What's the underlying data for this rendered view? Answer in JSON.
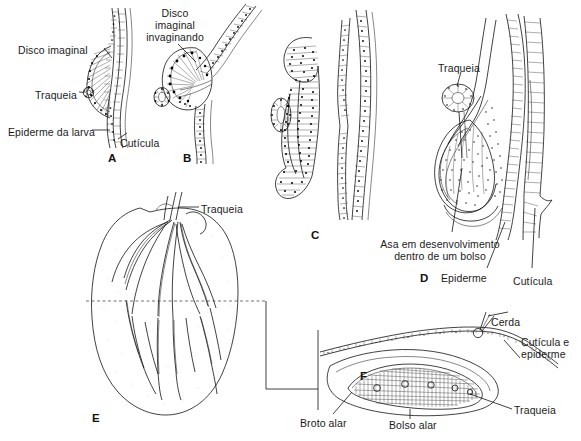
{
  "figure": {
    "language": "pt-BR",
    "style": "line-art scientific illustration, black ink on white"
  },
  "panels": [
    {
      "id": "A",
      "letter": "A",
      "letter_pos": {
        "x": 108,
        "y": 152
      },
      "labels": [
        {
          "key": "disco-imaginal",
          "text": "Disco imaginal",
          "x": 18,
          "y": 44,
          "align": "left"
        },
        {
          "key": "traqueia",
          "text": "Traqueia",
          "x": 35,
          "y": 89,
          "align": "left"
        },
        {
          "key": "epiderme-da-larva",
          "text": "Epiderme da larva",
          "x": 8,
          "y": 126,
          "align": "left"
        },
        {
          "key": "cuticula",
          "text": "Cutícula",
          "x": 120,
          "y": 137,
          "align": "left"
        }
      ]
    },
    {
      "id": "B",
      "letter": "B",
      "letter_pos": {
        "x": 183,
        "y": 152
      },
      "labels": [
        {
          "key": "disco-imaginal-invaginando",
          "text": "Disco\nimaginal\ninvaginando",
          "x": 150,
          "y": 7,
          "align": "center"
        }
      ]
    },
    {
      "id": "C",
      "letter": "C",
      "letter_pos": {
        "x": 311,
        "y": 229
      },
      "labels": []
    },
    {
      "id": "D",
      "letter": "D",
      "letter_pos": {
        "x": 420,
        "y": 272
      },
      "labels": [
        {
          "key": "traqueia",
          "text": "Traqueia",
          "x": 438,
          "y": 62,
          "align": "left"
        },
        {
          "key": "asa-em-desenvolvimento",
          "text": "Asa em desenvolvimento\ndentro de um bolso",
          "x": 365,
          "y": 238,
          "align": "left"
        },
        {
          "key": "epiderme",
          "text": "Epiderme",
          "x": 441,
          "y": 272,
          "align": "left"
        },
        {
          "key": "cuticula",
          "text": "Cutícula",
          "x": 513,
          "y": 275,
          "align": "left"
        }
      ]
    },
    {
      "id": "E",
      "letter": "E",
      "letter_pos": {
        "x": 92,
        "y": 412
      },
      "labels": [
        {
          "key": "traqueia",
          "text": "Traqueia",
          "x": 201,
          "y": 203,
          "align": "left"
        }
      ]
    },
    {
      "id": "F",
      "letter": "F",
      "letter_pos": {
        "x": 360,
        "y": 370
      },
      "labels": [
        {
          "key": "cerda",
          "text": "Cerda",
          "x": 491,
          "y": 316,
          "align": "left"
        },
        {
          "key": "cuticula-e-epiderme",
          "text": "Cutícula e\nepiderme",
          "x": 521,
          "y": 336,
          "align": "left"
        },
        {
          "key": "traqueia",
          "text": "Traqueia",
          "x": 514,
          "y": 404,
          "align": "left"
        },
        {
          "key": "broto-alar",
          "text": "Broto alar",
          "x": 300,
          "y": 417,
          "align": "left"
        },
        {
          "key": "bolso-alar",
          "text": "Bolso alar",
          "x": 389,
          "y": 419,
          "align": "left"
        }
      ]
    }
  ],
  "caption": {
    "text": "",
    "visible": false
  },
  "colors": {
    "ink": "#111111",
    "background": "#ffffff",
    "pale_fill": "#f4f4f4",
    "caption_grey": "#cfcfcf"
  }
}
